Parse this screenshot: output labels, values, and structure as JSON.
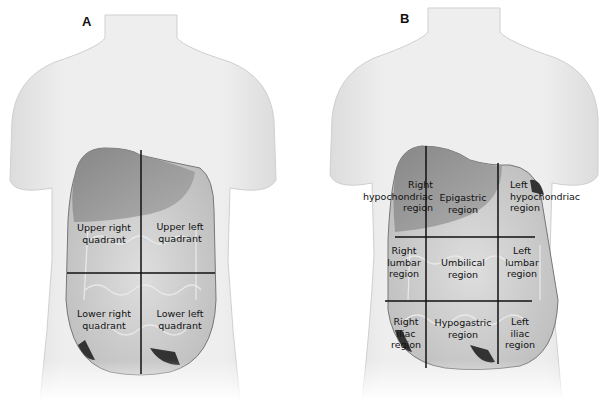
{
  "panels": [
    {
      "label": "A",
      "title": "Four abdominal quadrants",
      "regions": [
        {
          "line1": "Upper right",
          "line2": "quadrant"
        },
        {
          "line1": "Upper left",
          "line2": "quadrant"
        },
        {
          "line1": "Lower right",
          "line2": "quadrant"
        },
        {
          "line1": "Lower left",
          "line2": "quadrant"
        }
      ]
    },
    {
      "label": "B",
      "title": "Nine abdominal regions",
      "regions": [
        {
          "line1": "Right",
          "line2": "hypochondriac",
          "line3": "region"
        },
        {
          "line1": "Epigastric",
          "line2": "region"
        },
        {
          "line1": "Left",
          "line2": "hypochondriac",
          "line3": "region"
        },
        {
          "line1": "Right",
          "line2": "lumbar",
          "line3": "region"
        },
        {
          "line1": "Umbilical",
          "line2": "region"
        },
        {
          "line1": "Left",
          "line2": "lumbar",
          "line3": "region"
        },
        {
          "line1": "Right",
          "line2": "iliac",
          "line3": "region"
        },
        {
          "line1": "Hypogastric",
          "line2": "region"
        },
        {
          "line1": "Left",
          "line2": "iliac",
          "line3": "region"
        }
      ]
    }
  ],
  "colors": {
    "skin": "#ececec",
    "skin_shade": "#d9d9d9",
    "organs": "#cfcfcf",
    "liver": "#8a8a8a",
    "divider": "#111111"
  }
}
